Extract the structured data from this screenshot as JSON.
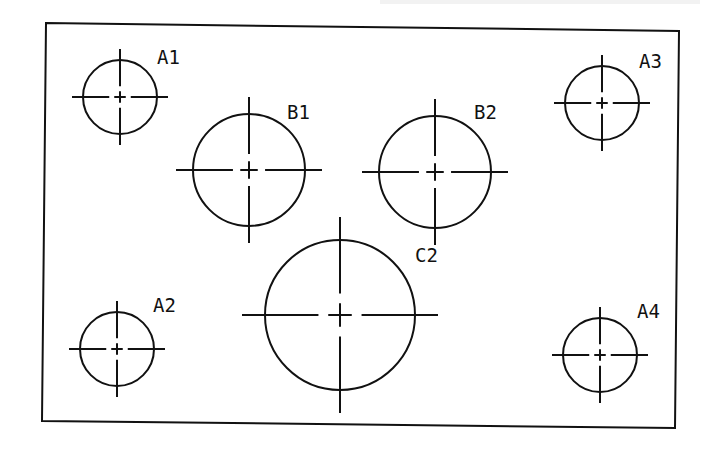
{
  "diagram": {
    "type": "plate-hole-layout",
    "outline": {
      "corners": [
        [
          46,
          23
        ],
        [
          679,
          31
        ],
        [
          675,
          428
        ],
        [
          42,
          421
        ]
      ],
      "color": "#111111"
    },
    "holes": [
      {
        "id": "A1",
        "label": "A1",
        "cx": 120,
        "cy": 97,
        "r": 37,
        "label_x": 157,
        "label_y": 64
      },
      {
        "id": "A2",
        "label": "A2",
        "cx": 117,
        "cy": 349,
        "r": 37,
        "label_x": 153,
        "label_y": 312
      },
      {
        "id": "A3",
        "label": "A3",
        "cx": 602,
        "cy": 103,
        "r": 37,
        "label_x": 639,
        "label_y": 68
      },
      {
        "id": "A4",
        "label": "A4",
        "cx": 600,
        "cy": 355,
        "r": 37,
        "label_x": 637,
        "label_y": 318
      },
      {
        "id": "B1",
        "label": "B1",
        "cx": 249,
        "cy": 170,
        "r": 56,
        "label_x": 287,
        "label_y": 119
      },
      {
        "id": "B2",
        "label": "B2",
        "cx": 435,
        "cy": 172,
        "r": 56,
        "label_x": 474,
        "label_y": 119
      },
      {
        "id": "C2",
        "label": "C2",
        "cx": 340,
        "cy": 315,
        "r": 75,
        "label_x": 415,
        "label_y": 262
      }
    ]
  }
}
